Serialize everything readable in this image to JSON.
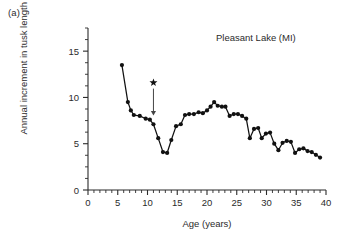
{
  "panel": {
    "label": "(a)"
  },
  "chart_data": {
    "type": "line",
    "title": "Pleasant Lake (MI)",
    "xlabel": "Age (years)",
    "ylabel": "Annual increment in tusk length (cm)",
    "xlim": [
      0,
      40
    ],
    "ylim": [
      0,
      17.5
    ],
    "xticks": [
      0,
      5,
      10,
      15,
      20,
      25,
      30,
      35,
      40
    ],
    "yticks": [
      0,
      5,
      10,
      15
    ],
    "x_minor_step": 1,
    "y_minor_step": 1.25,
    "grid": false,
    "legend": "none",
    "marker": "filled-circle",
    "series": [
      {
        "name": "Annual increment in tusk length",
        "x": [
          5.7,
          6.7,
          7.2,
          7.7,
          8.7,
          9.7,
          10.4,
          11.0,
          11.8,
          12.6,
          13.3,
          14.0,
          14.8,
          15.6,
          16.3,
          17.0,
          17.8,
          18.6,
          19.3,
          20.0,
          20.6,
          21.2,
          21.8,
          22.5,
          23.1,
          23.8,
          24.5,
          25.2,
          25.9,
          26.6,
          27.2,
          27.9,
          28.6,
          29.2,
          29.9,
          30.6,
          31.3,
          32.0,
          32.7,
          33.4,
          34.1,
          34.8,
          35.5,
          36.2,
          36.9,
          37.6,
          38.3,
          39.0
        ],
        "y": [
          13.5,
          9.5,
          8.6,
          8.1,
          8.0,
          7.7,
          7.6,
          7.1,
          5.6,
          4.1,
          4.0,
          5.4,
          6.9,
          7.1,
          8.1,
          8.2,
          8.2,
          8.4,
          8.3,
          8.6,
          9.0,
          9.5,
          9.1,
          9.0,
          9.0,
          8.0,
          8.2,
          8.2,
          8.0,
          7.7,
          5.6,
          6.6,
          6.7,
          5.6,
          6.1,
          6.2,
          5.0,
          4.3,
          5.1,
          5.3,
          5.2,
          4.0,
          4.4,
          4.5,
          4.2,
          4.1,
          3.8,
          3.5
        ]
      }
    ],
    "annotations": [
      {
        "name": "star-marker",
        "symbol": "star",
        "x": 11.0,
        "y": 11.6,
        "arrow_to_x": 11.0,
        "arrow_to_y": 8.0,
        "description": "star with arrow pointing to age 11 data point"
      }
    ]
  }
}
